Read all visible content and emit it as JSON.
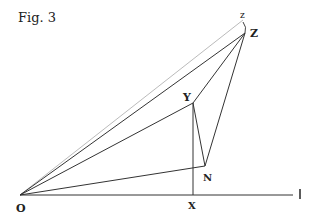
{
  "caption": "Fig. 3",
  "points": {
    "O": {
      "label": "O",
      "x": 20,
      "y": 195
    },
    "X": {
      "label": "X",
      "x": 193,
      "y": 195
    },
    "I": {
      "label": "I",
      "x": 293,
      "y": 195
    },
    "Y": {
      "label": "Y",
      "x": 193,
      "y": 103
    },
    "N": {
      "label": "N",
      "x": 205,
      "y": 166
    },
    "Z": {
      "label": "Z",
      "x": 245,
      "y": 33
    },
    "z": {
      "label": "z",
      "x": 243,
      "y": 20
    }
  },
  "labels": {
    "O": "O",
    "X": "X",
    "I": "I",
    "Y": "Y",
    "N": "N",
    "Z": "Z",
    "z": "z"
  }
}
